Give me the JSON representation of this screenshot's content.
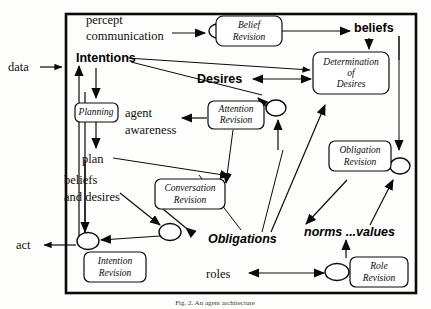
{
  "figure": {
    "caption": "Fig. 2. An agent architecture",
    "frame": {
      "x": 66,
      "y": 14,
      "width": 350,
      "height": 279
    }
  },
  "nodes": [
    {
      "id": "belief-revision",
      "label_line1": "Belief",
      "label_line2": "Revision",
      "x": 249,
      "y": 31,
      "w": 66,
      "h": 30
    },
    {
      "id": "determination-of-desires",
      "label_line1": "Determination",
      "label_line2": "of",
      "label_line3": "Desires",
      "x": 351,
      "y": 73,
      "w": 76,
      "h": 42
    },
    {
      "id": "planning",
      "label_line1": "Planning",
      "label_line2": "",
      "x": 96,
      "y": 112,
      "w": 43,
      "h": 19
    },
    {
      "id": "attention-revision",
      "label_line1": "Attention",
      "label_line2": "Revision",
      "x": 236,
      "y": 115,
      "w": 56,
      "h": 28
    },
    {
      "id": "obligation-revision",
      "label_line1": "Obligation",
      "label_line2": "Revision",
      "x": 360,
      "y": 156,
      "w": 62,
      "h": 30
    },
    {
      "id": "conversation-revision",
      "label_line1": "Conversation",
      "label_line2": "Revision",
      "x": 190,
      "y": 194,
      "w": 70,
      "h": 30
    },
    {
      "id": "intention-revision",
      "label_line1": "Intention",
      "label_line2": "Revision",
      "x": 115,
      "y": 267,
      "w": 62,
      "h": 30
    },
    {
      "id": "role-revision",
      "label_line1": "Role",
      "label_line2": "Revision",
      "x": 379,
      "y": 272,
      "w": 58,
      "h": 30
    }
  ],
  "junctions": [
    {
      "id": "junction-belief",
      "cx": 218,
      "cy": 31,
      "rx": 9,
      "ry": 7
    },
    {
      "id": "junction-attention",
      "cx": 276,
      "cy": 108,
      "rx": 10,
      "ry": 8
    },
    {
      "id": "junction-conversation",
      "cx": 170,
      "cy": 232,
      "rx": 11,
      "ry": 8.5
    },
    {
      "id": "junction-intention",
      "cx": 88,
      "cy": 241,
      "rx": 11,
      "ry": 8.5
    },
    {
      "id": "junction-obligation",
      "cx": 400,
      "cy": 166,
      "rx": 10,
      "ry": 8
    },
    {
      "id": "junction-role",
      "cx": 337,
      "cy": 272,
      "rx": 12,
      "ry": 8.5
    }
  ],
  "flow_labels": [
    {
      "id": "percept",
      "text": "percept",
      "x": 86,
      "y": 24,
      "style": "serif"
    },
    {
      "id": "communication",
      "text": "communication",
      "x": 86,
      "y": 40,
      "style": "serif"
    },
    {
      "id": "data",
      "text": "data",
      "x": 8,
      "y": 71,
      "style": "serif"
    },
    {
      "id": "intentions",
      "text": "Intentions",
      "x": 76,
      "y": 62,
      "style": "bold"
    },
    {
      "id": "beliefs",
      "text": "beliefs",
      "x": 366,
      "y": 30,
      "style": "bold"
    },
    {
      "id": "desires",
      "text": "Desires",
      "x": 211,
      "y": 81,
      "style": "bold"
    },
    {
      "id": "agent",
      "text": "agent",
      "x": 144,
      "y": 113,
      "style": "serif"
    },
    {
      "id": "awareness",
      "text": "awareness",
      "x": 144,
      "y": 131,
      "style": "serif"
    },
    {
      "id": "plan",
      "text": "plan",
      "x": 96,
      "y": 160,
      "style": "serif"
    },
    {
      "id": "beliefs-and",
      "text": "beliefs",
      "x": 96,
      "y": 181,
      "style": "serif"
    },
    {
      "id": "and-desires",
      "text": "and desires",
      "x": 96,
      "y": 198,
      "style": "serif"
    },
    {
      "id": "obligations",
      "text": "Obligations",
      "x": 247,
      "y": 239,
      "style": "bolditalic"
    },
    {
      "id": "norms-values",
      "text": "norms ...values",
      "x": 316,
      "y": 234,
      "style": "bolditalic"
    },
    {
      "id": "act",
      "text": "act",
      "x": 19,
      "y": 248,
      "style": "serif"
    },
    {
      "id": "roles",
      "text": "roles",
      "x": 221,
      "y": 277,
      "style": "serif"
    }
  ],
  "colors": {
    "stroke": "#0a0a0a",
    "background": "#fdfdfb",
    "node_fill": "#ffffff"
  }
}
